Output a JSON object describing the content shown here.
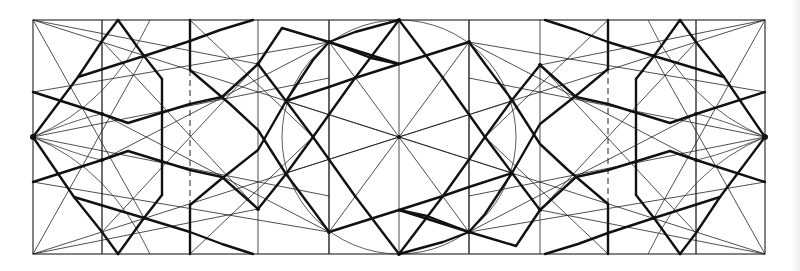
{
  "figure": {
    "title": "",
    "frame": {
      "x": 33,
      "y": 20,
      "width": 732,
      "height": 234
    },
    "center": {
      "x": 399,
      "y": 137
    },
    "colors": {
      "background": "#ffffff",
      "line": "#111111",
      "thin_line": "#222222"
    },
    "central_circle_radius": 117,
    "verticals_left": [
      102,
      162,
      190,
      258,
      329
    ],
    "verticals_right": [
      469,
      540,
      608,
      636,
      696
    ],
    "labels": []
  }
}
